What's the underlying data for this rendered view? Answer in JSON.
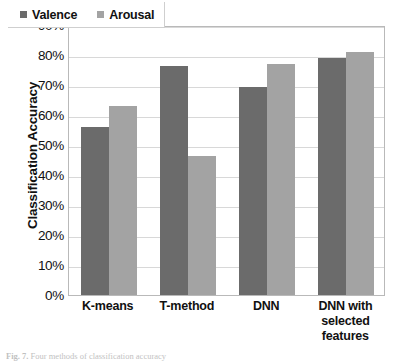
{
  "chart_data": {
    "type": "bar",
    "title": "",
    "xlabel": "",
    "ylabel": "Classification Accuracy",
    "ylim": [
      0,
      90
    ],
    "grid": true,
    "legend_position": "top-left",
    "categories": [
      "K-means",
      "T-method",
      "DNN",
      "DNN with selected features"
    ],
    "category_lines": [
      [
        "K-means"
      ],
      [
        "T-method"
      ],
      [
        "DNN"
      ],
      [
        "DNN with",
        "selected",
        "features"
      ]
    ],
    "series": [
      {
        "name": "Valence",
        "color": "#6b6b6b",
        "values": [
          56,
          76.5,
          69.5,
          79
        ]
      },
      {
        "name": "Arousal",
        "color": "#a3a3a3",
        "values": [
          63,
          46.5,
          77,
          81
        ]
      }
    ],
    "y_ticks": [
      {
        "value": 90,
        "label": "90%"
      },
      {
        "value": 80,
        "label": "80%"
      },
      {
        "value": 70,
        "label": "70%"
      },
      {
        "value": 60,
        "label": "60%"
      },
      {
        "value": 50,
        "label": "50%"
      },
      {
        "value": 40,
        "label": "40%"
      },
      {
        "value": 30,
        "label": "30%"
      },
      {
        "value": 20,
        "label": "20%"
      },
      {
        "value": 10,
        "label": "10%"
      },
      {
        "value": 0,
        "label": "0%"
      }
    ]
  },
  "legend": {
    "entries": [
      {
        "label": "Valence",
        "color": "#6b6b6b"
      },
      {
        "label": "Arousal",
        "color": "#a3a3a3"
      }
    ]
  },
  "caption": {
    "label": "Fig. 7.",
    "text": "Four methods of classification accuracy"
  }
}
